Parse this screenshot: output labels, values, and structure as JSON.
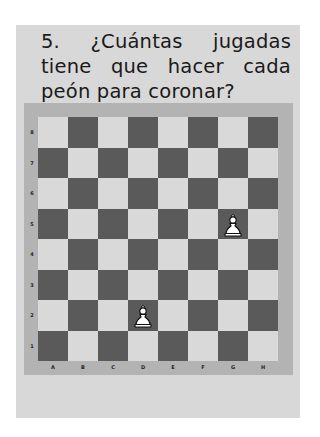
{
  "question": {
    "text": "5. ¿Cuántas jugadas tiene que hacer cada peón para coronar?"
  },
  "board": {
    "ranks": [
      "8",
      "7",
      "6",
      "5",
      "4",
      "3",
      "2",
      "1"
    ],
    "files": [
      "A",
      "B",
      "C",
      "D",
      "E",
      "F",
      "G",
      "H"
    ],
    "top_left_square": "light",
    "colors": {
      "light": "#d9d9d9",
      "dark": "#5a5a5a",
      "frame": "#b3b3b3"
    },
    "pieces": [
      {
        "type": "pawn",
        "color": "white",
        "square": "G5",
        "icon": "white-pawn-icon"
      },
      {
        "type": "pawn",
        "color": "white",
        "square": "D2",
        "icon": "white-pawn-icon"
      }
    ]
  }
}
